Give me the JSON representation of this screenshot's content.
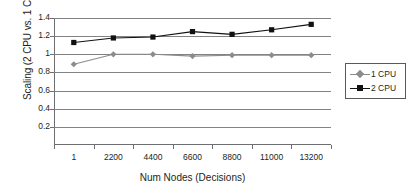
{
  "chart_data": {
    "type": "line",
    "title": "",
    "xlabel": "Num Nodes (Decisions)",
    "ylabel": "Scaling (2 CPU vs. 1 CPU)",
    "categories": [
      "1",
      "2200",
      "4400",
      "6600",
      "8800",
      "11000",
      "13200"
    ],
    "ylim": [
      0,
      1.4
    ],
    "yticks": [
      "1.4",
      "1.2",
      "1",
      "0.8",
      "0.6",
      "0.4",
      "0.2"
    ],
    "ytick_values": [
      1.4,
      1.2,
      1.0,
      0.8,
      0.6,
      0.4,
      0.2
    ],
    "grid": true,
    "legend_position": "right",
    "series": [
      {
        "name": "1 CPU",
        "values": [
          0.89,
          1.0,
          1.0,
          0.98,
          0.99,
          0.99,
          0.99
        ],
        "color": "#8c8c8c",
        "marker": "diamond"
      },
      {
        "name": "2 CPU",
        "values": [
          1.13,
          1.18,
          1.19,
          1.25,
          1.22,
          1.27,
          1.33
        ],
        "color": "#111111",
        "marker": "square"
      }
    ]
  },
  "legend": {
    "entries": [
      {
        "label": "1 CPU"
      },
      {
        "label": "2 CPU"
      }
    ]
  }
}
